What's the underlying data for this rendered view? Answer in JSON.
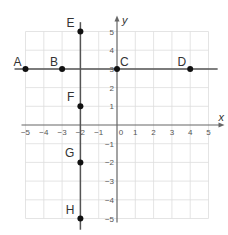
{
  "diagram": {
    "type": "coordinate-grid",
    "axes": {
      "x_label": "x",
      "y_label": "y",
      "x_range": [
        -5,
        5
      ],
      "y_range": [
        -5,
        5
      ],
      "x_ticks": [
        "-5",
        "-4",
        "-3",
        "-2",
        "-1",
        "0",
        "1",
        "2",
        "3",
        "4",
        "5"
      ],
      "y_ticks": [
        "5",
        "4",
        "3",
        "2",
        "1",
        "-1",
        "-2",
        "-3",
        "-4",
        "-5"
      ],
      "grid": true
    },
    "lines": [
      {
        "name": "horizontal-line-y3",
        "from": [
          -5.6,
          3
        ],
        "to": [
          5.5,
          3
        ]
      },
      {
        "name": "vertical-line-xneg2",
        "from": [
          -2,
          5.5
        ],
        "to": [
          -2,
          -5.6
        ]
      }
    ],
    "points": [
      {
        "label": "A",
        "x": -5,
        "y": 3
      },
      {
        "label": "B",
        "x": -3,
        "y": 3
      },
      {
        "label": "C",
        "x": 0,
        "y": 3
      },
      {
        "label": "D",
        "x": 4,
        "y": 3
      },
      {
        "label": "E",
        "x": -2,
        "y": 5
      },
      {
        "label": "F",
        "x": -2,
        "y": 1
      },
      {
        "label": "G",
        "x": -2,
        "y": -2
      },
      {
        "label": "H",
        "x": -2,
        "y": -5
      }
    ],
    "colors": {
      "grid": "#dddddd",
      "axis": "#666666",
      "line": "#555555",
      "point": "#111111"
    }
  }
}
